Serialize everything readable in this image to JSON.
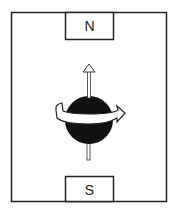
{
  "diagram": {
    "north_label": "N",
    "south_label": "S",
    "colors": {
      "line": "#222222",
      "sphere": "#111111",
      "background": "#ffffff"
    }
  }
}
